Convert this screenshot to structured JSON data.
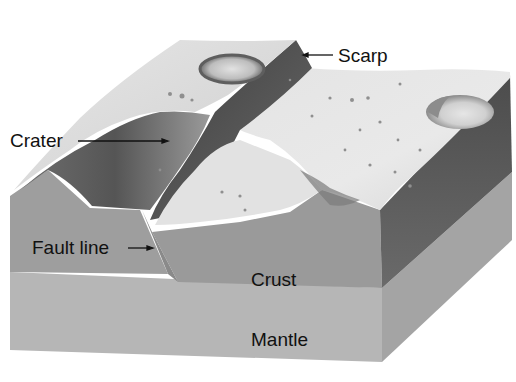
{
  "diagram": {
    "type": "3d-block-cross-section",
    "labels": {
      "scarp": "Scarp",
      "crater": "Crater",
      "fault_line": "Fault line",
      "crust": "Crust",
      "mantle": "Mantle"
    },
    "layers": [
      {
        "name": "Crust",
        "color": "#9a9a9a"
      },
      {
        "name": "Mantle",
        "color": "#b4b4b4"
      }
    ],
    "colors": {
      "surface_light": "#e8e8e8",
      "surface_mid": "#cfcfcf",
      "scarp_face": "#4a4a4a",
      "side_face": "#5c5c5c",
      "crust_front": "#9c9c9c",
      "mantle_front": "#b6b6b6",
      "mantle_side": "#a8a8a8",
      "text": "#111111",
      "arrow": "#111111"
    }
  }
}
